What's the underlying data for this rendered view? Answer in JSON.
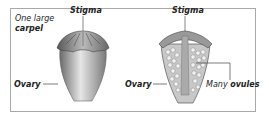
{
  "diagram": {
    "left": {
      "caption_line1": "One large",
      "caption_line2": "carpel",
      "stigma_label": "Stigma",
      "ovary_label": "Ovary"
    },
    "right": {
      "stigma_label": "Stigma",
      "ovary_label": "Ovary",
      "ovules_prefix": "Many",
      "ovules_label": "ovules"
    },
    "colors": {
      "border": "#a8a8a8",
      "carpel_fill": "#c8c8c8",
      "ovule_fill": "#f2f2f2",
      "text": "#222222"
    }
  }
}
